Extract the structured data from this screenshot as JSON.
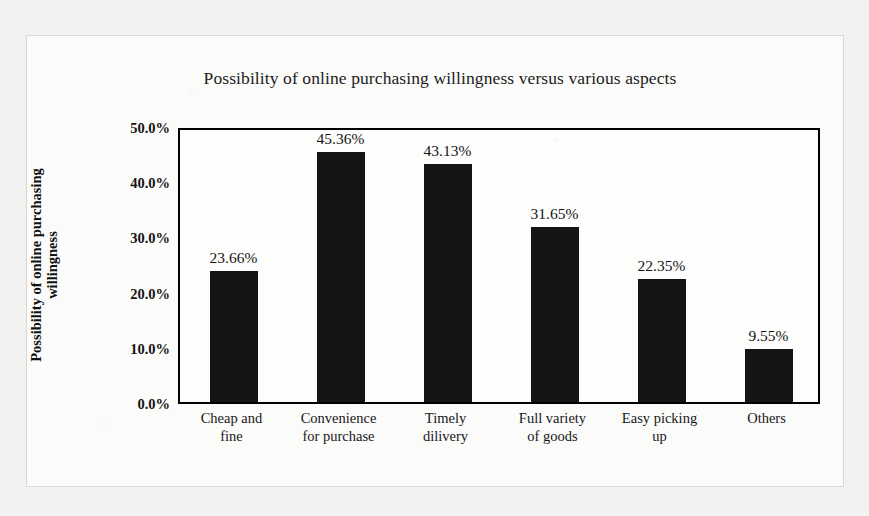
{
  "chart_data": {
    "type": "bar",
    "title": "Possibility of online purchasing willingness versus various aspects",
    "xlabel": "",
    "ylabel": "Possibility of online purchasing willingness",
    "ylabel_lines": [
      "Possibility of online purchasing",
      "willingness"
    ],
    "categories": [
      "Cheap and fine",
      "Convenience for purchase",
      "Timely dilivery",
      "Full  variety of goods",
      "Easy picking up",
      "Others"
    ],
    "category_lines": [
      [
        "Cheap and",
        "fine"
      ],
      [
        "Convenience",
        "for purchase"
      ],
      [
        "Timely",
        "dilivery"
      ],
      [
        "Full  variety",
        "of goods"
      ],
      [
        "Easy picking",
        "up"
      ],
      [
        "Others"
      ]
    ],
    "values": [
      23.66,
      45.36,
      43.13,
      31.65,
      22.35,
      9.55
    ],
    "value_labels": [
      "23.66%",
      "45.36%",
      "43.13%",
      "31.65%",
      "22.35%",
      "9.55%"
    ],
    "ylim": [
      0,
      50
    ],
    "ytick_values": [
      0,
      10,
      20,
      30,
      40,
      50
    ],
    "ytick_labels": [
      "0.0%",
      "10.0%",
      "20.0%",
      "30.0%",
      "40.0%",
      "50.0%"
    ],
    "grid": false,
    "legend": false,
    "bar_color": "#141414",
    "plot_border_color": "#000000",
    "background_color": "#fbfbfa"
  }
}
